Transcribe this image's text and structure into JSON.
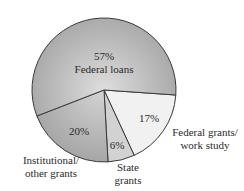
{
  "chart_data": {
    "type": "pie",
    "title": "",
    "categories": [
      "Federal loans",
      "Federal grants/work study",
      "State grants",
      "Institutional/other grants"
    ],
    "values": [
      57,
      17,
      6,
      20
    ],
    "unit": "%",
    "labels": {
      "federal_loans": {
        "pct": "57%",
        "name": "Federal loans"
      },
      "federal_grants": {
        "pct": "17%",
        "name_line1": "Federal grants/",
        "name_line2": "work study"
      },
      "state_grants": {
        "pct": "6%",
        "name_line1": "State",
        "name_line2": "grants"
      },
      "institutional": {
        "pct": "20%",
        "name_line1": "Institutional/",
        "name_line2": "other grants"
      }
    },
    "legend": "none (labels placed on/around slices)",
    "grid": false
  },
  "colors": {
    "federal_loans_light": "#d9d9d9",
    "federal_loans_dark": "#a9a9a9",
    "federal_grants": "#f1f1f1",
    "state_grants": "#d2d2d2",
    "institutional_light": "#cfcfcf",
    "institutional_dark": "#a5a5a5",
    "stroke": "#3a3a3a"
  }
}
